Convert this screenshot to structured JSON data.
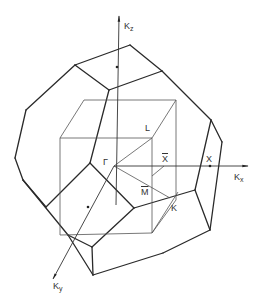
{
  "diagram": {
    "title": "",
    "type": "brillouin-zone-fcc",
    "colors": {
      "line": "#2a2a2a",
      "thin": "#555555",
      "background": "#ffffff"
    },
    "labels": {
      "kz": {
        "main": "K",
        "sub": "z"
      },
      "kx": {
        "main": "K",
        "sub": "x"
      },
      "ky": {
        "main": "K",
        "sub": "y"
      },
      "gamma": "Γ",
      "L": "L",
      "X_bar": "X",
      "X": "X",
      "M_bar": "M",
      "K": "K"
    },
    "outer_edges": [
      [
        75,
        65,
        130,
        45
      ],
      [
        130,
        45,
        162,
        71
      ],
      [
        162,
        71,
        109,
        90
      ],
      [
        109,
        90,
        75,
        65
      ],
      [
        75,
        65,
        26,
        110
      ],
      [
        26,
        110,
        15,
        158
      ],
      [
        15,
        158,
        23,
        180
      ],
      [
        162,
        71,
        211,
        120
      ],
      [
        211,
        120,
        222,
        142
      ],
      [
        109,
        90,
        90,
        163
      ],
      [
        90,
        163,
        46,
        207
      ],
      [
        90,
        163,
        134,
        208
      ],
      [
        134,
        208,
        92,
        247
      ],
      [
        134,
        208,
        195,
        190
      ],
      [
        195,
        190,
        210,
        230
      ],
      [
        211,
        120,
        195,
        190
      ],
      [
        222,
        142,
        210,
        230
      ],
      [
        23,
        180,
        46,
        207
      ],
      [
        23,
        180,
        68,
        235
      ],
      [
        68,
        235,
        92,
        247
      ],
      [
        68,
        235,
        93,
        275
      ],
      [
        92,
        247,
        93,
        275
      ],
      [
        93,
        275,
        163,
        253
      ],
      [
        163,
        253,
        210,
        230
      ]
    ],
    "inner_edges": [
      [
        84,
        100,
        176,
        100
      ],
      [
        84,
        100,
        60,
        138
      ],
      [
        176,
        100,
        152,
        138
      ],
      [
        60,
        138,
        152,
        138
      ],
      [
        60,
        138,
        60,
        235
      ],
      [
        152,
        138,
        152,
        233
      ],
      [
        176,
        100,
        176,
        200
      ],
      [
        60,
        235,
        152,
        233
      ],
      [
        152,
        233,
        176,
        200
      ],
      [
        114,
        166,
        152,
        138
      ],
      [
        114,
        166,
        170,
        198
      ],
      [
        152,
        176,
        164,
        166
      ],
      [
        152,
        233,
        178,
        192
      ]
    ],
    "axes": {
      "kz": [
        116,
        205,
        119,
        16
      ],
      "kx": [
        114,
        166,
        248,
        166
      ],
      "ky": [
        114,
        166,
        53,
        279
      ]
    },
    "points": [
      [
        117,
        67
      ],
      [
        210,
        166
      ],
      [
        88,
        207
      ]
    ]
  }
}
